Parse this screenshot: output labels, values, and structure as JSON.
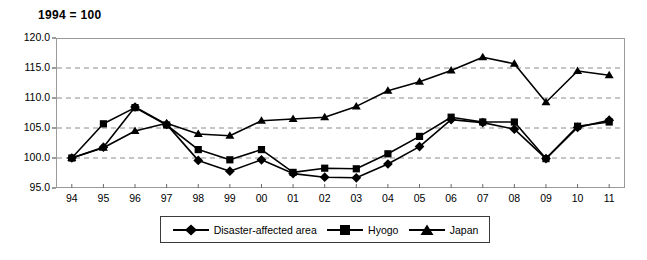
{
  "chart_data": {
    "type": "line",
    "title": "1994 = 100",
    "xlabel": "",
    "ylabel": "",
    "ylim": [
      95.0,
      120.0
    ],
    "ytick_step": 5.0,
    "yticks": [
      "120.0",
      "115.0",
      "110.0",
      "105.0",
      "100.0",
      "95.0"
    ],
    "grid": "horizontal dashed gridlines at 115.0, 110.0, 105.0, 100.0",
    "legend_position": "bottom-center",
    "categories": [
      "94",
      "95",
      "96",
      "97",
      "98",
      "99",
      "00",
      "01",
      "02",
      "03",
      "04",
      "05",
      "06",
      "07",
      "08",
      "09",
      "10",
      "11"
    ],
    "series": [
      {
        "name": "Disaster-affected area",
        "marker": "diamond",
        "values": [
          100.0,
          101.8,
          108.5,
          105.6,
          99.6,
          97.8,
          99.7,
          97.4,
          96.8,
          96.7,
          99.0,
          101.9,
          106.4,
          105.9,
          104.8,
          99.9,
          105.1,
          106.3
        ]
      },
      {
        "name": "Hyogo",
        "marker": "square",
        "values": [
          100.0,
          105.7,
          108.4,
          105.5,
          101.4,
          99.7,
          101.4,
          97.6,
          98.3,
          98.2,
          100.7,
          103.6,
          106.8,
          106.0,
          106.0,
          99.9,
          105.3,
          106.0
        ]
      },
      {
        "name": "Japan",
        "marker": "triangle",
        "values": [
          100.0,
          101.7,
          104.5,
          105.8,
          104.0,
          103.7,
          106.2,
          106.5,
          106.8,
          108.6,
          111.2,
          112.7,
          114.6,
          116.8,
          115.7,
          109.3,
          114.5,
          113.8
        ]
      }
    ]
  },
  "legend": {
    "items": [
      {
        "label": "Disaster-affected area",
        "marker": "diamond"
      },
      {
        "label": "Hyogo",
        "marker": "square"
      },
      {
        "label": "Japan",
        "marker": "triangle"
      }
    ]
  }
}
